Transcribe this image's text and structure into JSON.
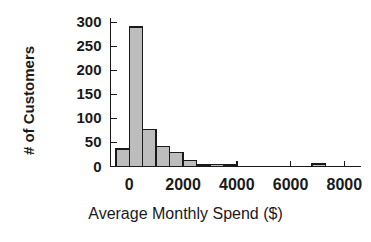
{
  "chart_data": {
    "type": "bar",
    "title": "",
    "subtitle": "",
    "xlabel": "Average Monthly Spend ($)",
    "ylabel": "# of Customers",
    "xlim": [
      -700,
      8600
    ],
    "ylim": [
      0,
      310
    ],
    "grid": false,
    "legend": "none",
    "bin_width": 500,
    "xticks": [
      0,
      2000,
      4000,
      6000,
      8000
    ],
    "xtick_labels": [
      "0",
      "2000",
      "4000",
      "6000",
      "8000"
    ],
    "yticks": [
      0,
      50,
      100,
      150,
      200,
      250,
      300
    ],
    "ytick_labels": [
      "0",
      "50",
      "100",
      "150",
      "200",
      "250",
      "300"
    ],
    "bins": [
      {
        "x0": -500,
        "x1": 0,
        "value": 36
      },
      {
        "x0": 0,
        "x1": 500,
        "value": 290
      },
      {
        "x0": 500,
        "x1": 1000,
        "value": 77
      },
      {
        "x0": 1000,
        "x1": 1500,
        "value": 41
      },
      {
        "x0": 1500,
        "x1": 2000,
        "value": 29
      },
      {
        "x0": 2000,
        "x1": 2500,
        "value": 12
      },
      {
        "x0": 2500,
        "x1": 3000,
        "value": 3
      },
      {
        "x0": 3000,
        "x1": 3500,
        "value": 4
      },
      {
        "x0": 3500,
        "x1": 4000,
        "value": 2
      },
      {
        "x0": 6800,
        "x1": 7300,
        "value": 5
      }
    ],
    "bar_fill": "#bdbdbd",
    "bar_stroke": "#1a1a1a",
    "axis_color": "#1a1a1a",
    "background": "#ffffff"
  }
}
